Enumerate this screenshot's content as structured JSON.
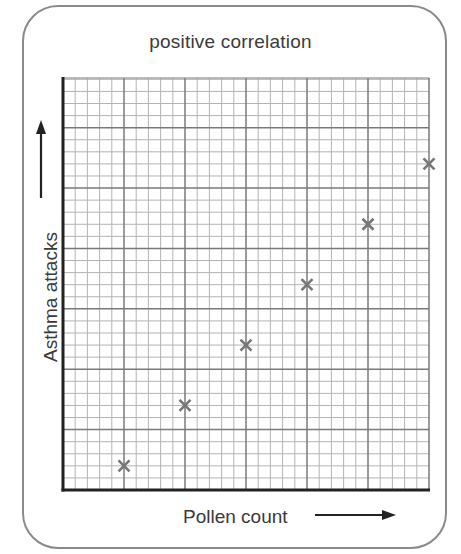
{
  "chart_data": {
    "type": "scatter",
    "title": "positive correlation",
    "xlabel": "Pollen count",
    "ylabel": "Asthma attacks",
    "grid": true,
    "grid_major_columns": 6,
    "grid_major_rows": 6.75,
    "grid_minor_per_major": 5,
    "xlim": [
      0,
      6
    ],
    "ylim": [
      0,
      6.75
    ],
    "tick_labels": "none",
    "marker": "x",
    "marker_color": "#777777",
    "points": [
      {
        "x": 1,
        "y": 0.4
      },
      {
        "x": 2,
        "y": 1.4
      },
      {
        "x": 3,
        "y": 2.4
      },
      {
        "x": 4,
        "y": 3.4
      },
      {
        "x": 5,
        "y": 4.4
      },
      {
        "x": 6,
        "y": 5.4
      }
    ],
    "x": [
      1,
      2,
      3,
      4,
      5,
      6
    ],
    "y": [
      0.4,
      1.4,
      2.4,
      3.4,
      4.4,
      5.4
    ]
  },
  "colors": {
    "major_grid": "#7a7a7a",
    "minor_grid": "#b4b4b4",
    "axis": "#222222",
    "text": "#3a3a3a",
    "border": "#8a8a8a"
  }
}
